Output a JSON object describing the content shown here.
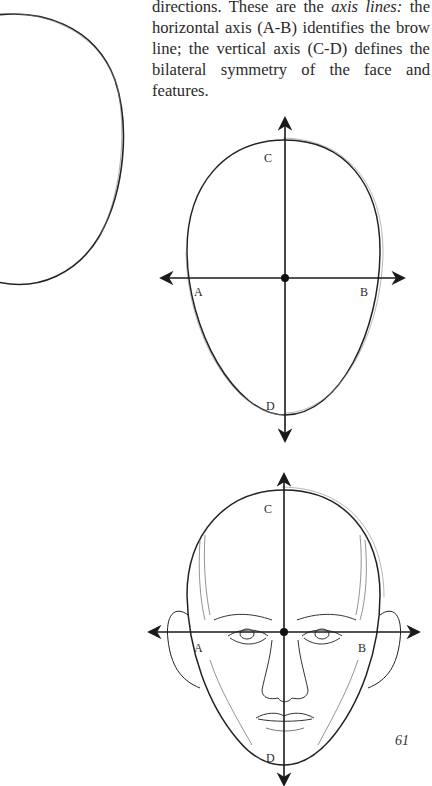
{
  "page": {
    "page_number": "61"
  },
  "paragraph": {
    "line1_prefix": "directions. These are the ",
    "line1_italic": "axis",
    "line2_italic": "lines:",
    "rest": " the horizontal axis (A-B) identifies the brow line; the vertical axis (C-D) defines the bilateral symmetry of the face and features."
  },
  "figures": {
    "left_oval": {
      "description": "Partial egg-shaped head oval (cropped at left edge)"
    },
    "axis_diagram": {
      "description": "Egg-shaped oval with axis lines",
      "labels": {
        "a": "A",
        "b": "B",
        "c": "C",
        "d": "D"
      }
    },
    "face_diagram": {
      "description": "Front view of a head drawn over the axis lines",
      "labels": {
        "a": "A",
        "b": "B",
        "c": "C",
        "d": "D"
      }
    }
  }
}
